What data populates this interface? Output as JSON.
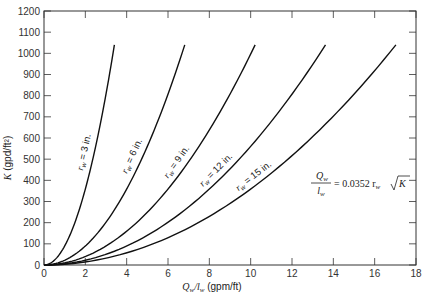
{
  "chart_data": {
    "type": "line",
    "title": "",
    "xlabel": "Q_w/l_w (gpm/ft)",
    "xlabel_parts": {
      "var": "Q",
      "sub1": "w",
      "slash": "/",
      "var2": "l",
      "sub2": "w",
      "unit": " (gpm/ft)"
    },
    "ylabel": "K (gpd/ft²)",
    "ylabel_parts": {
      "var": "K",
      "unit": " (gpd/ft²)"
    },
    "xlim": [
      0,
      18
    ],
    "ylim": [
      0,
      1200
    ],
    "xticks": [
      0,
      2,
      4,
      6,
      8,
      10,
      12,
      14,
      16,
      18
    ],
    "yticks": [
      0,
      100,
      200,
      300,
      400,
      500,
      600,
      700,
      800,
      900,
      1000,
      1100,
      1200
    ],
    "grid": false,
    "legend": "inline curve labels",
    "equation": {
      "lhs_num": "Q",
      "lhs_num_sub": "w",
      "lhs_den": "l",
      "lhs_den_sub": "w",
      "rhs": "= 0.0352 r",
      "rhs_sub": "w",
      "sqrt_arg": "K"
    },
    "formula": "Q_w/l_w = 0.0352 r_w sqrt(K)",
    "k_max": 1040,
    "series": [
      {
        "name": "r_w = 3 in.",
        "label_var": "r",
        "label_sub": "w",
        "label_text": " = 3 in.",
        "r_w": 3,
        "x": [
          0,
          0.38,
          0.76,
          1.14,
          1.52,
          1.9,
          2.28,
          2.66,
          3.04,
          3.41
        ],
        "y": [
          0,
          13,
          52,
          117,
          208,
          325,
          468,
          637,
          832,
          1040
        ]
      },
      {
        "name": "r_w = 6 in.",
        "label_var": "r",
        "label_sub": "w",
        "label_text": " = 6 in.",
        "r_w": 6,
        "x": [
          0,
          0.76,
          1.52,
          2.28,
          3.04,
          3.8,
          4.56,
          5.32,
          6.08,
          6.81
        ],
        "y": [
          0,
          13,
          52,
          117,
          208,
          325,
          468,
          637,
          832,
          1040
        ]
      },
      {
        "name": "r_w = 9 in.",
        "label_var": "r",
        "label_sub": "w",
        "label_text": " = 9 in.",
        "r_w": 9,
        "x": [
          0,
          1.14,
          2.28,
          3.42,
          4.56,
          5.7,
          6.84,
          7.98,
          9.12,
          10.22
        ],
        "y": [
          0,
          13,
          52,
          117,
          208,
          325,
          468,
          637,
          832,
          1040
        ]
      },
      {
        "name": "r_w = 12 in.",
        "label_var": "r",
        "label_sub": "w",
        "label_text": " = 12 in.",
        "r_w": 12,
        "x": [
          0,
          1.52,
          3.04,
          4.56,
          6.08,
          7.6,
          9.12,
          10.64,
          12.16,
          13.62
        ],
        "y": [
          0,
          13,
          52,
          117,
          208,
          325,
          468,
          637,
          832,
          1040
        ]
      },
      {
        "name": "r_w = 15 in.",
        "label_var": "r",
        "label_sub": "w",
        "label_text": " = 15 in.",
        "r_w": 15,
        "x": [
          0,
          1.9,
          3.8,
          5.7,
          7.6,
          9.5,
          11.4,
          13.3,
          15.2,
          17.03
        ],
        "y": [
          0,
          13,
          52,
          117,
          208,
          325,
          468,
          637,
          832,
          1040
        ]
      }
    ]
  },
  "colors": {
    "line": "#111111",
    "axis": "#333333",
    "background": "#ffffff"
  }
}
